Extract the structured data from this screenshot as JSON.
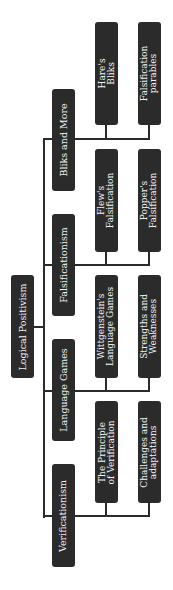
{
  "diagram": {
    "type": "tree",
    "orientation": "rotated-90",
    "colors": {
      "node_fill": "#2b2b2b",
      "node_text": "#f2f2f2",
      "connector": "#2b2b2b",
      "background": "#ffffff"
    },
    "root": {
      "label": "Logical Positivism"
    },
    "branches": [
      {
        "label": "Bliks and More",
        "children": [
          {
            "label1": "Hare's",
            "label2": "Bliks"
          },
          {
            "label1": "Falsification",
            "label2": "parables"
          }
        ]
      },
      {
        "label": "Falsificationism",
        "children": [
          {
            "label1": "Flew's",
            "label2": "Falsification"
          },
          {
            "label1": "Popper's",
            "label2": "Falsification"
          }
        ]
      },
      {
        "label": "Language Games",
        "children": [
          {
            "label1": "Wittgenstein's",
            "label2": "Language Games"
          },
          {
            "label1": "Strengths and",
            "label2": "Weaknesses"
          }
        ]
      },
      {
        "label": "Verificationism",
        "children": [
          {
            "label1": "The Principle",
            "label2": "of Verification"
          },
          {
            "label1": "Challenges and",
            "label2": "adaptations"
          }
        ]
      }
    ]
  }
}
